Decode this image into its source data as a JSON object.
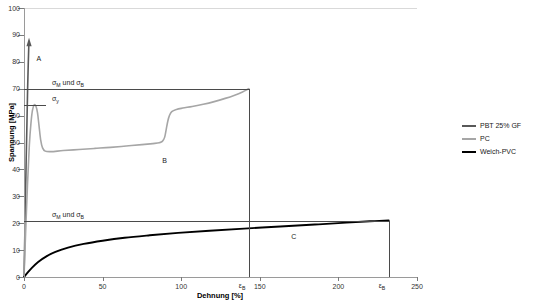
{
  "chart_data": {
    "type": "line",
    "title": "",
    "xlabel": "Dehnung [%]",
    "ylabel": "Spannung [MPa]",
    "xlim": [
      0,
      250
    ],
    "ylim": [
      0,
      100
    ],
    "xticks": [
      0,
      50,
      100,
      150,
      200,
      250
    ],
    "yticks": [
      0,
      10,
      20,
      30,
      40,
      50,
      60,
      70,
      80,
      90,
      100
    ],
    "grid": false,
    "legend_position": "right",
    "series": [
      {
        "name": "PBT 25% GF",
        "label": "A",
        "color": "#595959",
        "width": 1.6,
        "points": [
          [
            0,
            0
          ],
          [
            0.4,
            12
          ],
          [
            0.9,
            28
          ],
          [
            1.4,
            44
          ],
          [
            1.9,
            58
          ],
          [
            2.3,
            70
          ],
          [
            2.7,
            79
          ],
          [
            3.0,
            85
          ],
          [
            3.2,
            87.5
          ]
        ]
      },
      {
        "name": "PC",
        "label": "B",
        "color": "#a6a6a6",
        "width": 1.6,
        "points": [
          [
            0,
            0
          ],
          [
            1.0,
            16
          ],
          [
            2.2,
            34
          ],
          [
            3.4,
            49
          ],
          [
            4.4,
            57
          ],
          [
            5.4,
            62
          ],
          [
            6.5,
            64
          ],
          [
            7.6,
            63.5
          ],
          [
            8.6,
            61
          ],
          [
            9.6,
            56
          ],
          [
            10.6,
            51
          ],
          [
            11.8,
            48
          ],
          [
            13.5,
            46.8
          ],
          [
            17,
            46.6
          ],
          [
            25,
            47.0
          ],
          [
            35,
            47.4
          ],
          [
            45,
            47.8
          ],
          [
            55,
            48.2
          ],
          [
            65,
            48.7
          ],
          [
            75,
            49.2
          ],
          [
            82,
            49.6
          ],
          [
            86,
            49.9
          ],
          [
            88,
            50.4
          ],
          [
            89.5,
            52
          ],
          [
            90.5,
            55
          ],
          [
            91.5,
            58
          ],
          [
            92.5,
            60
          ],
          [
            94,
            61.5
          ],
          [
            97,
            62.3
          ],
          [
            101,
            62.8
          ],
          [
            107,
            63.4
          ],
          [
            114,
            64.2
          ],
          [
            121,
            65.2
          ],
          [
            128,
            66.4
          ],
          [
            134,
            67.6
          ],
          [
            139,
            68.8
          ],
          [
            142,
            69.7
          ],
          [
            143,
            70.0
          ]
        ]
      },
      {
        "name": "Weich-PVC",
        "label": "C",
        "color": "#000000",
        "width": 1.9,
        "points": [
          [
            0,
            0
          ],
          [
            2,
            1.4
          ],
          [
            5,
            3.4
          ],
          [
            9,
            5.6
          ],
          [
            14,
            7.6
          ],
          [
            20,
            9.3
          ],
          [
            28,
            10.9
          ],
          [
            38,
            12.3
          ],
          [
            50,
            13.5
          ],
          [
            64,
            14.6
          ],
          [
            80,
            15.5
          ],
          [
            98,
            16.4
          ],
          [
            118,
            17.2
          ],
          [
            140,
            18.0
          ],
          [
            163,
            18.8
          ],
          [
            185,
            19.5
          ],
          [
            205,
            20.2
          ],
          [
            220,
            20.7
          ],
          [
            232,
            21.0
          ]
        ]
      }
    ],
    "annotations": {
      "stress_lines": [
        {
          "id": "sigma-mb-pc",
          "value": 70,
          "label_html": "σ<sub>M</sub> und  σ<sub>B</sub>",
          "label_text": "σM und σB",
          "x_end": 143
        },
        {
          "id": "sigma-y-pc",
          "value": 64,
          "label_html": "σ<sub>y</sub>",
          "label_text": "σy",
          "x_end": 14
        },
        {
          "id": "sigma-mb-pvc",
          "value": 21,
          "label_html": "σ<sub>M</sub> und  σ<sub>B</sub>",
          "label_text": "σM und σB",
          "x_end": 232
        }
      ],
      "strain_lines": [
        {
          "id": "eps-b-pc",
          "value": 143,
          "label_html": "ε<sub>B</sub>",
          "label_text": "εB",
          "y_top": 70
        },
        {
          "id": "eps-b-pvc",
          "value": 232,
          "label_html": "ε<sub>B</sub>",
          "label_text": "εB",
          "y_top": 21
        }
      ],
      "curve_labels": [
        {
          "id": "label-a",
          "text": "A",
          "x": 8,
          "y": 81
        },
        {
          "id": "label-b",
          "text": "B",
          "x": 88,
          "y": 43
        },
        {
          "id": "label-c",
          "text": "C",
          "x": 170,
          "y": 15
        }
      ],
      "arrow_on_curve_a": true
    }
  },
  "axes": {
    "y": {
      "title": "Spannung [MPa]",
      "tick_labels": [
        "0",
        "10",
        "20",
        "30",
        "40",
        "50",
        "60",
        "70",
        "80",
        "90",
        "100"
      ]
    },
    "x": {
      "title": "Dehnung [%]",
      "tick_labels": [
        "0",
        "50",
        "100",
        "150",
        "200",
        "250"
      ]
    }
  },
  "legend": {
    "items": [
      {
        "label": "PBT 25% GF",
        "color": "#595959",
        "thickness": "2px"
      },
      {
        "label": "PC",
        "color": "#a6a6a6",
        "thickness": "2px"
      },
      {
        "label": "Weich-PVC",
        "color": "#000000",
        "thickness": "2px"
      }
    ]
  }
}
